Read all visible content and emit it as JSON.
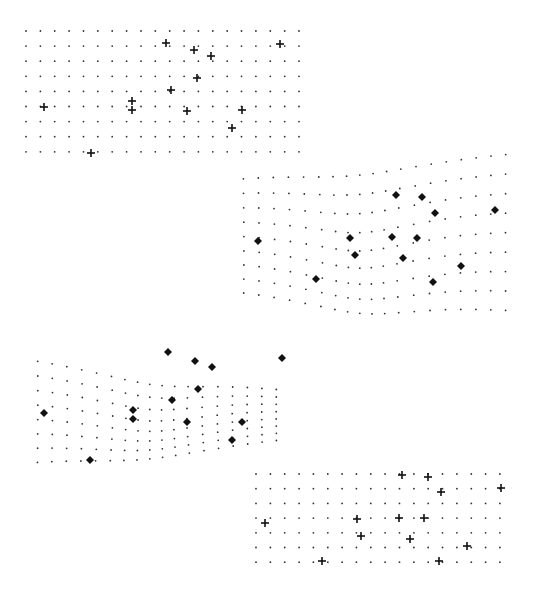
{
  "figure": {
    "colors": {
      "dot": "#333333",
      "marker": "#111111",
      "background": "#ffffff"
    }
  },
  "panels": [
    {
      "id": "panel-top-left",
      "kind": "regular",
      "marker": "plus",
      "grid": {
        "x0": 26,
        "y0": 31,
        "cols": 20,
        "rows": 9,
        "dx": 14.37,
        "dy": 15.1
      },
      "landmarks": [
        [
          166,
          43
        ],
        [
          194,
          50
        ],
        [
          211,
          56
        ],
        [
          280,
          44
        ],
        [
          197,
          78
        ],
        [
          171,
          90
        ],
        [
          44,
          107
        ],
        [
          132,
          101
        ],
        [
          132,
          110
        ],
        [
          187,
          111
        ],
        [
          242,
          110
        ],
        [
          232,
          128
        ],
        [
          91,
          153
        ]
      ]
    },
    {
      "id": "panel-top-right",
      "kind": "warped",
      "marker": "diamond",
      "grid": {
        "x0": 243,
        "y0": 178,
        "cols": 19,
        "rows": 9,
        "dx": 14.6,
        "dy": 14.2,
        "warp": {
          "cx": 360,
          "cy": 250,
          "amp": 18,
          "tilt": 0.09
        }
      },
      "landmarks": [
        [
          396,
          195
        ],
        [
          422,
          197
        ],
        [
          435,
          213
        ],
        [
          495,
          210
        ],
        [
          258,
          241
        ],
        [
          350,
          238
        ],
        [
          392,
          237
        ],
        [
          417,
          238
        ],
        [
          355,
          255
        ],
        [
          403,
          258
        ],
        [
          461,
          266
        ],
        [
          433,
          282
        ],
        [
          316,
          279
        ]
      ]
    },
    {
      "id": "panel-bottom-left",
      "kind": "warped",
      "marker": "diamond",
      "grid": {
        "x0": 37,
        "y0": 360,
        "cols": 18,
        "rows": 8,
        "dx": 14.1,
        "dy": 14.5,
        "warp": {
          "cx": 150,
          "cy": 400,
          "amp": 14,
          "tilt": -0.12
        }
      },
      "landmarks": [
        [
          168,
          352
        ],
        [
          195,
          361
        ],
        [
          212,
          367
        ],
        [
          282,
          358
        ],
        [
          198,
          389
        ],
        [
          172,
          400
        ],
        [
          44,
          413
        ],
        [
          133,
          410
        ],
        [
          133,
          419
        ],
        [
          187,
          422
        ],
        [
          242,
          422
        ],
        [
          232,
          440
        ],
        [
          90,
          460
        ]
      ]
    },
    {
      "id": "panel-bottom-right",
      "kind": "regular",
      "marker": "plus",
      "grid": {
        "x0": 256,
        "y0": 474,
        "cols": 18,
        "rows": 7,
        "dx": 14.35,
        "dy": 14.7
      },
      "landmarks": [
        [
          402,
          475
        ],
        [
          428,
          477
        ],
        [
          441,
          492
        ],
        [
          501,
          488
        ],
        [
          265,
          523
        ],
        [
          357,
          519
        ],
        [
          399,
          518
        ],
        [
          424,
          518
        ],
        [
          361,
          536
        ],
        [
          410,
          539
        ],
        [
          467,
          546
        ],
        [
          439,
          561
        ],
        [
          322,
          561
        ]
      ]
    }
  ]
}
